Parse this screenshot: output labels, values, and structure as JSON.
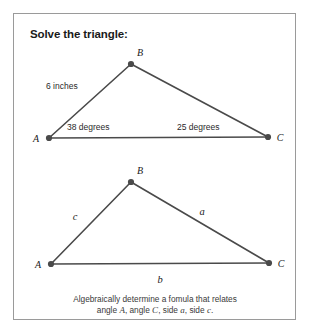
{
  "figure": {
    "title": "Solve the triangle:",
    "border_color": "#9a9a9a",
    "stroke_color": "#4a4a4a",
    "background": "#ffffff"
  },
  "triangle_top": {
    "vertices": {
      "A": "A",
      "B": "B",
      "C": "C"
    },
    "side_label_ab": "6 inches",
    "angle_a": "38 degrees",
    "angle_c": "25 degrees"
  },
  "triangle_bottom": {
    "vertices": {
      "A": "A",
      "B": "B",
      "C": "C"
    },
    "side_c": "c",
    "side_a": "a",
    "side_b": "b"
  },
  "caption": {
    "line1": "Algebraically determine a fomula that relates",
    "line2_pre": "angle ",
    "line2_a": "A",
    "line2_mid1": ", angle ",
    "line2_c": "C",
    "line2_mid2": ", side ",
    "line2_a2": "a",
    "line2_mid3": ", side ",
    "line2_c2": "c",
    "line2_end": "."
  }
}
